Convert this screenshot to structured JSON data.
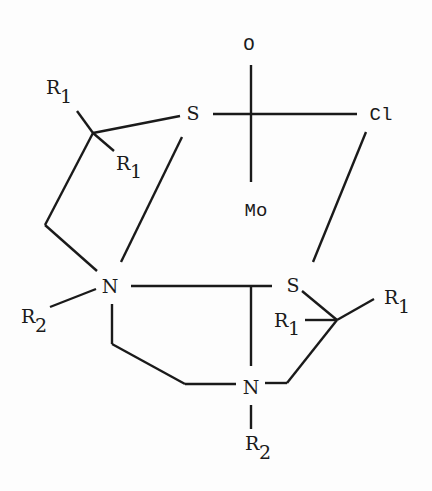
{
  "diagram": {
    "type": "chemical-structure",
    "atoms": {
      "oxygen": "O",
      "chlorine": "Cl",
      "molybdenum": "Mo",
      "sulfur_top": "S",
      "sulfur_right": "S",
      "nitrogen_left": "N",
      "nitrogen_bottom": "N"
    },
    "substituents": {
      "r1_top_left": {
        "base": "R",
        "sub": "1"
      },
      "r1_inner_left": {
        "base": "R",
        "sub": "1"
      },
      "r1_right_outer": {
        "base": "R",
        "sub": "1"
      },
      "r1_right_inner": {
        "base": "R",
        "sub": "1"
      },
      "r2_left": {
        "base": "R",
        "sub": "2"
      },
      "r2_bottom": {
        "base": "R",
        "sub": "2"
      }
    }
  }
}
